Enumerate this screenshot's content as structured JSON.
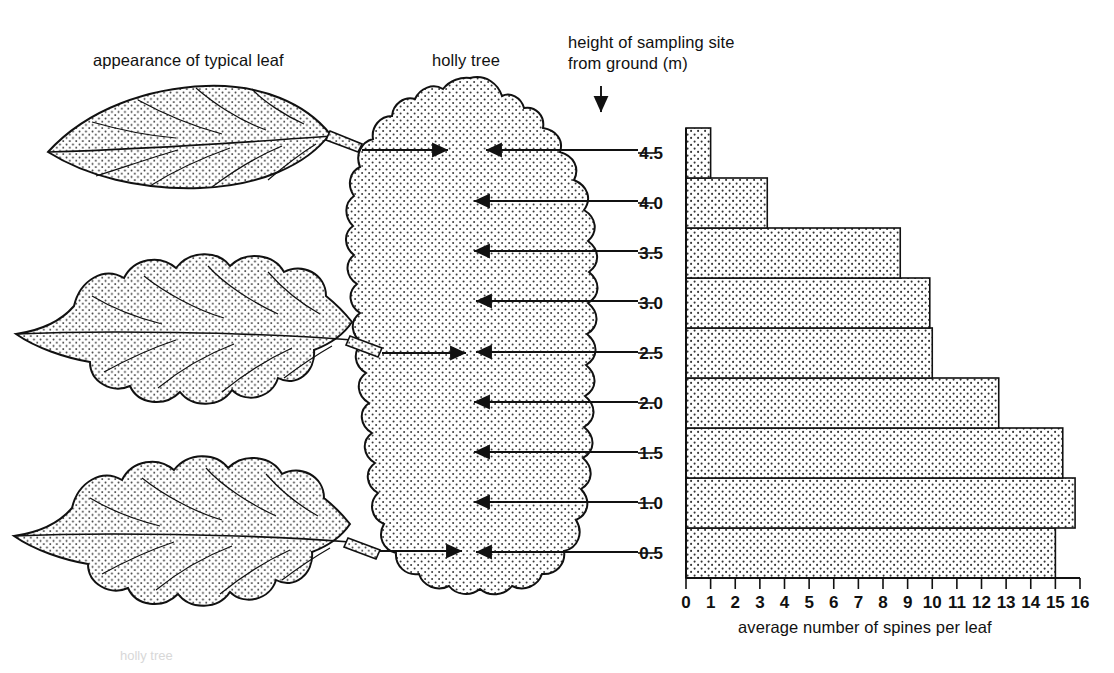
{
  "labels": {
    "leaf_column": "appearance of typical leaf",
    "tree_column": "holly tree",
    "axis_note_line1": "height of sampling site",
    "axis_note_line2": "from ground (m)",
    "x_axis_title": "average number of spines per leaf"
  },
  "icons": {
    "down_arrow": "down-arrow-icon",
    "pointer_arrow": "right-arrow-icon"
  },
  "leaves": [
    {
      "name": "smooth-leaf",
      "height_m": "4.5",
      "spines": 0,
      "description": "smooth entire margin, no spines"
    },
    {
      "name": "spiny-leaf-mid",
      "height_m": "2.5",
      "spines": 10,
      "description": "spiny margin, about ten spines"
    },
    {
      "name": "spiny-leaf-low",
      "height_m": "0.5",
      "spines": 15,
      "description": "very spiny margin, about fifteen spines"
    }
  ],
  "chart_data": {
    "type": "bar",
    "orientation": "horizontal",
    "title": "",
    "xlabel": "average number of spines per leaf",
    "ylabel": "height of sampling site from ground (m)",
    "categories": [
      "0.5",
      "1.0",
      "1.5",
      "2.0",
      "2.5",
      "3.0",
      "3.5",
      "4.0",
      "4.5"
    ],
    "values": [
      15.0,
      15.8,
      15.3,
      12.7,
      10.0,
      9.9,
      8.7,
      3.3,
      1.0
    ],
    "xlim": [
      0,
      16
    ],
    "ylim": [
      0.25,
      4.75
    ],
    "xticks": [
      "0",
      "1",
      "2",
      "3",
      "4",
      "5",
      "6",
      "7",
      "8",
      "9",
      "10",
      "11",
      "12",
      "13",
      "14",
      "15",
      "16"
    ],
    "yticks": [
      "0.5",
      "1.0",
      "1.5",
      "2.0",
      "2.5",
      "3.0",
      "3.5",
      "4.0",
      "4.5"
    ],
    "grid": false,
    "legend": "none",
    "bar_fill": "#ffffff",
    "bar_pattern": "stipple-dots",
    "bar_edge_color": "#111111"
  }
}
